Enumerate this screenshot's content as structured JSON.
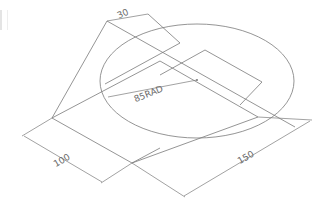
{
  "drawing": {
    "type": "isometric-technical-drawing",
    "dimensions": {
      "top_offset": "30",
      "radius": "85RAD",
      "depth": "100",
      "length": "150"
    },
    "colors": {
      "line": "#7a7a7a",
      "text": "#6a6a6a",
      "background": "#ffffff"
    }
  }
}
